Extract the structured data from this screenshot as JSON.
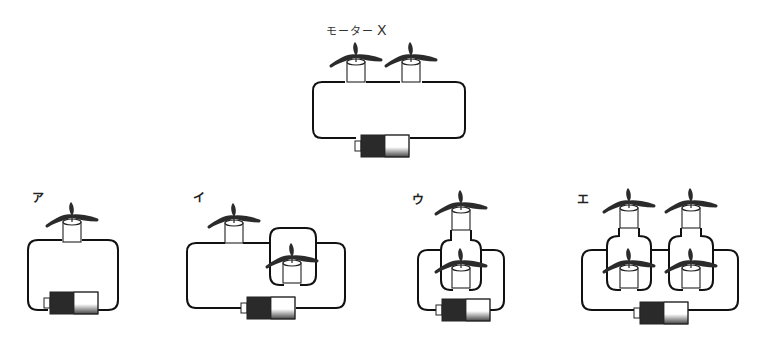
{
  "title": {
    "text": "モーター",
    "letter": "X"
  },
  "options": [
    {
      "label": "ア",
      "description": "one motor in series with battery"
    },
    {
      "label": "イ",
      "description": "one motor in series with a parallel loop containing one motor"
    },
    {
      "label": "ウ",
      "description": "two motors in parallel loop connected to battery"
    },
    {
      "label": "エ",
      "description": "two parallel pairs of motors in series with battery"
    }
  ],
  "reference": {
    "motor_count": 2,
    "arrangement": "series"
  },
  "colors": {
    "wire": "#111111",
    "battery_dark": "#2a2a2a",
    "battery_light": "#ffffff",
    "blade": "#2b2b2b"
  }
}
